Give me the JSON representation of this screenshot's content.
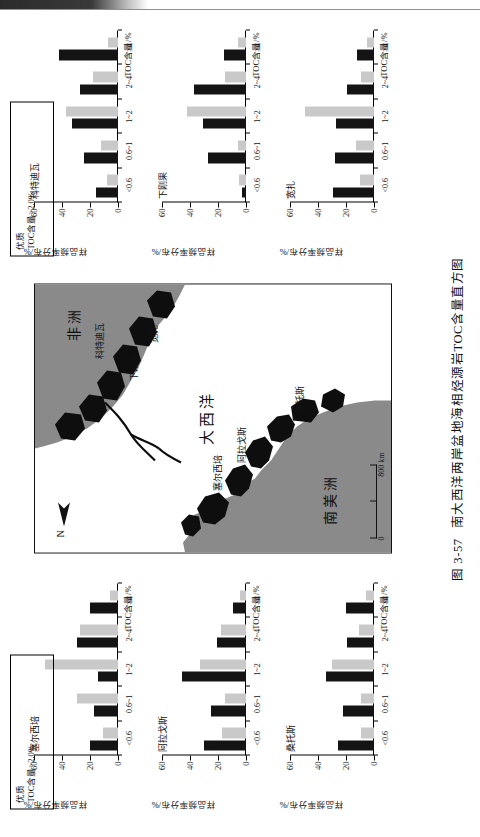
{
  "caption": {
    "number": "图 3-57",
    "text": "南大西洋两岸盆地海相烃源岩TOC含量直方图"
  },
  "axes": {
    "x_title": "TOC含量/%",
    "y_title": "样品频率分布/%",
    "x_ticklabels": [
      "<0.6",
      "0.6~1",
      "1~2",
      "2~4",
      ">4"
    ],
    "y_ticklabels": [
      "0",
      "20",
      "40",
      "60"
    ],
    "ylim": [
      0,
      60
    ]
  },
  "quality_box": {
    "line1": "优质",
    "line2": "TOC含量>2.0%"
  },
  "map": {
    "ocean_label": "大西洋",
    "continent_left": "南美洲",
    "continent_right": "非洲",
    "basin_labels": [
      "塞尔西培",
      "阿拉戈斯",
      "桑托斯",
      "科特迪瓦",
      "下刚果",
      "宽扎"
    ],
    "north_label": "N",
    "scale_low": "0",
    "scale_high": "800 km"
  },
  "chart_data": [
    {
      "type": "bar",
      "title": "塞尔西培",
      "panel": "left",
      "index": 0,
      "categories": [
        "<0.6",
        "0.6~1",
        "1~2",
        "2~4",
        ">4"
      ],
      "xlabel": "TOC含量/%",
      "ylabel": "样品频率分布/%",
      "ylim": [
        0,
        60
      ],
      "series": [
        {
          "name": "dark",
          "values": [
            20,
            17,
            14,
            29,
            20
          ]
        },
        {
          "name": "light",
          "values": [
            11,
            29,
            52,
            27,
            6
          ]
        }
      ]
    },
    {
      "type": "bar",
      "title": "阿拉戈斯",
      "panel": "left",
      "index": 1,
      "categories": [
        "<0.6",
        "0.6~1",
        "1~2",
        "2~4",
        ">4"
      ],
      "xlabel": "TOC含量/%",
      "ylabel": "样品频率分布/%",
      "ylim": [
        0,
        60
      ],
      "series": [
        {
          "name": "dark",
          "values": [
            30,
            25,
            46,
            21,
            9
          ]
        },
        {
          "name": "light",
          "values": [
            17,
            15,
            33,
            18,
            4
          ]
        }
      ]
    },
    {
      "type": "bar",
      "title": "桑托斯",
      "panel": "left",
      "index": 2,
      "categories": [
        "<0.6",
        "0.6~1",
        "1~2",
        "2~4",
        ">4"
      ],
      "xlabel": "TOC含量/%",
      "ylabel": "样品频率分布/%",
      "ylim": [
        0,
        60
      ],
      "series": [
        {
          "name": "dark",
          "values": [
            26,
            22,
            34,
            19,
            20
          ]
        },
        {
          "name": "light",
          "values": [
            9,
            9,
            30,
            11,
            6
          ]
        }
      ]
    },
    {
      "type": "bar",
      "title": "科特迪瓦",
      "panel": "right",
      "index": 0,
      "categories": [
        "<0.6",
        "0.6~1",
        "1~2",
        "2~4",
        ">4"
      ],
      "xlabel": "TOC含量/%",
      "ylabel": "样品频率分布/%",
      "ylim": [
        0,
        60
      ],
      "series": [
        {
          "name": "dark",
          "values": [
            16,
            24,
            33,
            27,
            42
          ]
        },
        {
          "name": "light",
          "values": [
            8,
            12,
            37,
            18,
            7
          ]
        }
      ]
    },
    {
      "type": "bar",
      "title": "下刚果",
      "panel": "right",
      "index": 1,
      "categories": [
        "<0.6",
        "0.6~1",
        "1~2",
        "2~4",
        ">4"
      ],
      "xlabel": "TOC含量/%",
      "ylabel": "样品频率分布/%",
      "ylim": [
        0,
        60
      ],
      "series": [
        {
          "name": "dark",
          "values": [
            3,
            27,
            31,
            37,
            16
          ]
        },
        {
          "name": "light",
          "values": [
            5,
            6,
            42,
            15,
            6
          ]
        }
      ]
    },
    {
      "type": "bar",
      "title": "宽扎",
      "panel": "right",
      "index": 2,
      "categories": [
        "<0.6",
        "0.6~1",
        "1~2",
        "2~4",
        ">4"
      ],
      "xlabel": "TOC含量/%",
      "ylabel": "样品频率分布/%",
      "ylim": [
        0,
        60
      ],
      "series": [
        {
          "name": "dark",
          "values": [
            29,
            28,
            27,
            19,
            12
          ]
        },
        {
          "name": "light",
          "values": [
            10,
            13,
            49,
            9,
            5
          ]
        }
      ]
    }
  ],
  "colors": {
    "dark_bar": "#141414",
    "light_bar": "#c9c9c9",
    "land": "#8a8a8a",
    "basin": "#0e0e0e",
    "sea": "#ffffff"
  }
}
